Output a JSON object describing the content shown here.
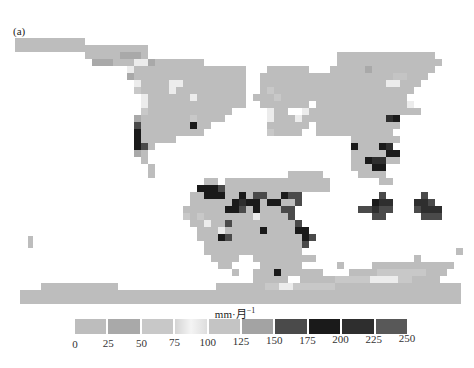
{
  "panel_label": "(a)",
  "colorbar": {
    "unit_label": "mm·月",
    "unit_exponent": "−1",
    "ticks": [
      "0",
      "25",
      "50",
      "75",
      "100",
      "125",
      "150",
      "175",
      "200",
      "225",
      "250"
    ],
    "bins": [
      {
        "range": "0-25",
        "color": "#bdbdbd"
      },
      {
        "range": "25-50",
        "color": "#a9a9a9"
      },
      {
        "range": "50-75",
        "color": "#c8c8c8"
      },
      {
        "range": "75-100",
        "color": "#ececec"
      },
      {
        "range": "100-125",
        "color": "#c4c4c4"
      },
      {
        "range": "125-150",
        "color": "#a3a3a3"
      },
      {
        "range": "150-175",
        "color": "#4a4a4a"
      },
      {
        "range": "175-200",
        "color": "#1a1a1a"
      },
      {
        "range": "200-225",
        "color": "#2e2e2e"
      },
      {
        "range": "225-250",
        "color": "#585858"
      }
    ]
  },
  "map": {
    "origin_x": 15,
    "origin_y": 38,
    "cell": 7,
    "legend": "'.' = no data; digits 0-9 = colorbar bin index",
    "rows": [
      "0000000000......................................................",
      "0000000000000000000.............................................",
      "..........000001110...........................00000000000000....",
      "...........1110003310000000...................000000000000000...",
      "................30000000000000000...000000...000001000000000....",
      "................10000000000000000..000000000000000000044000.....",
      ".................3000033000000000..00000000000000000033000......",
      ".................2000030000000000..0200000000000000000000.......",
      "..................300000030000000.0002000000000000000000........",
      "..................300000000000000..0000000.00000000000003.......",
      "..................2000000000000.....300..30000000000000000......",
      ".................1000000020000......3000300000000000087..........",
      ".................60000000700........000000.000000000000.........",
      ".................7000000000.........20000..00000000000..........",
      ".................700000.........................0000000.........",
      ".................760............................700078..........",
      ".................10.............................0000077..........",
      "..................0.............................0078800.........",
      "...................0............................00077..........",
      "...................0...................00000.....0000...........",
      "...........................00.000000000000000.......00..........",
      "..........................7776000000000000000....................",
      ".........................0077700706600766...........6.....6.....",
      ".........................0000007877077006..........788...886....",
      "........................0000007760700066.........66866...6888...",
      "........................2020000000300006...........66.....666...",
      ".........................0030060000000006.............................",
      "..........................0003000007000077.............................",
      "..........................00076000000000076...............................",
      "...........................000000000000006......................",
      "...........................00000000000000......................0",
      "............................0000..000000000..............0......",
      ".............................00....000000.....0....000000..0....",
      "...............................0..0007000000.......0007000......",
      "..................................00000..........0000070000.....",
      "..................................000............00000000000....",
      "....................................0..............0000000......",
      "................................................................",
      "................................................................",
      "................................................................"
    ],
    "antarctica_rows": [
      "....................................................0000000000..",
      "...............................................00002222222000...",
      "........................................00000222223333220000....",
      "...00000000000..............00000002233222222000000000000000000.",
      "000000000000000000000000000000000000000000000000000000000000000.",
      "000000000000000000000000000000000000000000000000000000000000000."
    ],
    "antarctica_origin_y": 262,
    "isolated_cells": [
      {
        "x": 28,
        "y": 236,
        "bin": 0,
        "note": "small island left"
      }
    ]
  }
}
